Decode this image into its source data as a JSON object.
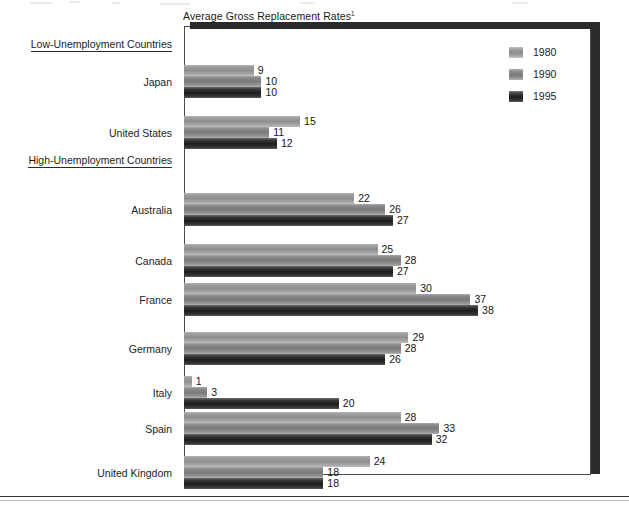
{
  "chart_data": {
    "type": "bar",
    "orientation": "horizontal",
    "title": "Average Gross Replacement Rates",
    "title_footnote_marker": "1",
    "xlabel": "",
    "ylabel": "",
    "xlim": [
      0,
      52
    ],
    "grid": false,
    "legend_position": "top-right",
    "legend": [
      "1980",
      "1990",
      "1995"
    ],
    "series": [
      {
        "name": "1980",
        "color": "#8f8f8f",
        "values": [
          9,
          15,
          22,
          25,
          30,
          29,
          1,
          28,
          24
        ]
      },
      {
        "name": "1990",
        "color": "#7a7a7a",
        "values": [
          10,
          11,
          26,
          28,
          37,
          28,
          3,
          33,
          18
        ]
      },
      {
        "name": "1995",
        "color": "#1d1d1d",
        "values": [
          10,
          12,
          27,
          27,
          38,
          26,
          20,
          32,
          18
        ]
      }
    ],
    "categories": [
      "Japan",
      "United States",
      "Australia",
      "Canada",
      "France",
      "Germany",
      "Italy",
      "Spain",
      "United Kingdom"
    ],
    "group_headers": [
      {
        "label": "Low-Unemployment Countries",
        "categories": [
          "Japan",
          "United States"
        ]
      },
      {
        "label": "High-Unemployment Countries",
        "categories": [
          "Australia",
          "Canada",
          "France",
          "Germany",
          "Italy",
          "Spain",
          "United Kingdom"
        ]
      }
    ],
    "annotations": [
      {
        "category": "Japan",
        "series": "1980",
        "value": 9
      },
      {
        "category": "Japan",
        "series": "1990",
        "value": 10
      },
      {
        "category": "Japan",
        "series": "1995",
        "value": 10
      },
      {
        "category": "United States",
        "series": "1980",
        "value": 15
      },
      {
        "category": "United States",
        "series": "1990",
        "value": 11
      },
      {
        "category": "United States",
        "series": "1995",
        "value": 12
      },
      {
        "category": "Australia",
        "series": "1980",
        "value": 22
      },
      {
        "category": "Australia",
        "series": "1990",
        "value": 26
      },
      {
        "category": "Australia",
        "series": "1995",
        "value": 27
      },
      {
        "category": "Canada",
        "series": "1980",
        "value": 25
      },
      {
        "category": "Canada",
        "series": "1990",
        "value": 28
      },
      {
        "category": "Canada",
        "series": "1995",
        "value": 27
      },
      {
        "category": "France",
        "series": "1980",
        "value": 30
      },
      {
        "category": "France",
        "series": "1990",
        "value": 37
      },
      {
        "category": "France",
        "series": "1995",
        "value": 38
      },
      {
        "category": "Germany",
        "series": "1980",
        "value": 29
      },
      {
        "category": "Germany",
        "series": "1990",
        "value": 28
      },
      {
        "category": "Germany",
        "series": "1995",
        "value": 26
      },
      {
        "category": "Italy",
        "series": "1980",
        "value": 1
      },
      {
        "category": "Italy",
        "series": "1990",
        "value": 3
      },
      {
        "category": "Italy",
        "series": "1995",
        "value": 20
      },
      {
        "category": "Spain",
        "series": "1980",
        "value": 28
      },
      {
        "category": "Spain",
        "series": "1990",
        "value": 33
      },
      {
        "category": "Spain",
        "series": "1995",
        "value": 32
      },
      {
        "category": "United Kingdom",
        "series": "1980",
        "value": 24
      },
      {
        "category": "United Kingdom",
        "series": "1990",
        "value": 18
      },
      {
        "category": "United Kingdom",
        "series": "1995",
        "value": 18
      }
    ]
  },
  "layout": {
    "px_per_unit": 7.74,
    "bar_height": 11,
    "group_header_rows": {
      "Low-Unemployment Countries": 18,
      "High-Unemployment Countries": 134
    },
    "group_row_tops": {
      "Japan": 39,
      "United States": 90,
      "Australia": 167,
      "Canada": 218,
      "France": 257,
      "Germany": 306,
      "Italy": 350,
      "Spain": 386,
      "United Kingdom": 430
    }
  },
  "colors": {
    "series_1980": "#8f8f8f",
    "series_1990": "#7a7a7a",
    "series_1995": "#1d1d1d",
    "frame": "#4a4a4a",
    "shadow": "#2c2c2c",
    "text": "#1c1c1c"
  }
}
